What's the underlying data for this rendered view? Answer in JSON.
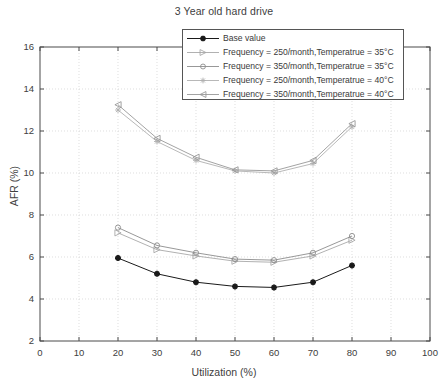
{
  "chart_data": {
    "type": "line",
    "title": "3 Year old hard drive",
    "xlabel": "Utilization (%)",
    "ylabel": "AFR (%)",
    "xlim": [
      0,
      100
    ],
    "ylim": [
      2,
      16
    ],
    "xticks": [
      0,
      10,
      20,
      30,
      40,
      50,
      60,
      70,
      80,
      90,
      100
    ],
    "yticks": [
      2,
      4,
      6,
      8,
      10,
      12,
      14,
      16
    ],
    "grid": true,
    "legend_position": "top-right",
    "x": [
      20,
      30,
      40,
      50,
      60,
      70,
      80
    ],
    "series": [
      {
        "name": "Base value",
        "marker": "star",
        "color": "#1a1a1a",
        "values": [
          5.95,
          5.2,
          4.8,
          4.6,
          4.55,
          4.8,
          5.6
        ]
      },
      {
        "name": "Frequency = 250/month,Temperatrue = 35°C",
        "marker": "triangle-right",
        "color": "#a8a8a8",
        "values": [
          7.15,
          6.35,
          6.05,
          5.8,
          5.75,
          6.05,
          6.8
        ]
      },
      {
        "name": "Frequency = 350/month,Temperatrue = 35°C",
        "marker": "circle",
        "color": "#8c8c8c",
        "values": [
          7.4,
          6.55,
          6.2,
          5.9,
          5.85,
          6.2,
          7.0
        ]
      },
      {
        "name": "Frequency = 250/month,Temperatrue = 40°C",
        "marker": "star",
        "color": "#b0b0b0",
        "values": [
          13.0,
          11.5,
          10.6,
          10.1,
          10.0,
          10.45,
          12.2
        ]
      },
      {
        "name": "Frequency = 350/month,Temperatrue = 40°C",
        "marker": "triangle-left",
        "color": "#999999",
        "values": [
          13.25,
          11.65,
          10.75,
          10.15,
          10.1,
          10.6,
          12.35
        ]
      }
    ]
  },
  "legend": {
    "items": [
      "Base value",
      "Frequency = 250/month,Temperatrue = 35°C",
      "Frequency = 350/month,Temperatrue = 35°C",
      "Frequency = 250/month,Temperatrue = 40°C",
      "Frequency = 350/month,Temperatrue = 40°C"
    ]
  },
  "ticks": {
    "x": [
      "0",
      "10",
      "20",
      "30",
      "40",
      "50",
      "60",
      "70",
      "80",
      "90",
      "100"
    ],
    "y": [
      "2",
      "4",
      "6",
      "8",
      "10",
      "12",
      "14",
      "16"
    ]
  }
}
